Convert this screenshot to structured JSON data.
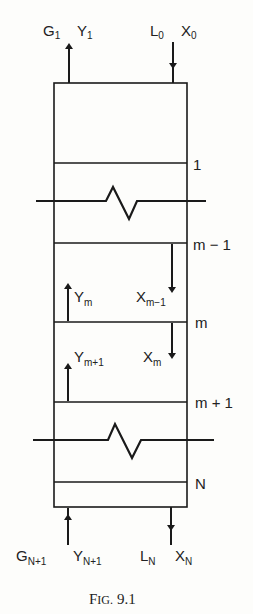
{
  "figure": {
    "caption": "FIG. 9.1",
    "caption_main": "F",
    "caption_small": "IG.",
    "caption_num": "9.1"
  },
  "top_streams": {
    "gas_out": {
      "G": "G",
      "G_sub": "1",
      "Y": "Y",
      "Y_sub": "1",
      "direction": "up"
    },
    "liquid_in": {
      "L": "L",
      "L_sub": "0",
      "X": "X",
      "X_sub": "0",
      "direction": "down"
    }
  },
  "bottom_streams": {
    "gas_in": {
      "G": "G",
      "G_sub": "N+1",
      "Y": "Y",
      "Y_sub": "N+1",
      "direction": "up"
    },
    "liquid_out": {
      "L": "L",
      "L_sub": "N",
      "X": "X",
      "X_sub": "N",
      "direction": "down"
    }
  },
  "stages": [
    {
      "label": "1"
    },
    {
      "label": "m − 1"
    },
    {
      "label": "m"
    },
    {
      "label": "m + 1"
    },
    {
      "label": "N"
    }
  ],
  "internal_flows": {
    "Y_m": {
      "base": "Y",
      "sub": "m"
    },
    "X_m_minus_1": {
      "base": "X",
      "sub": "m−1"
    },
    "Y_m_plus_1": {
      "base": "Y",
      "sub": "m+1"
    },
    "X_m": {
      "base": "X",
      "sub": "m"
    }
  }
}
